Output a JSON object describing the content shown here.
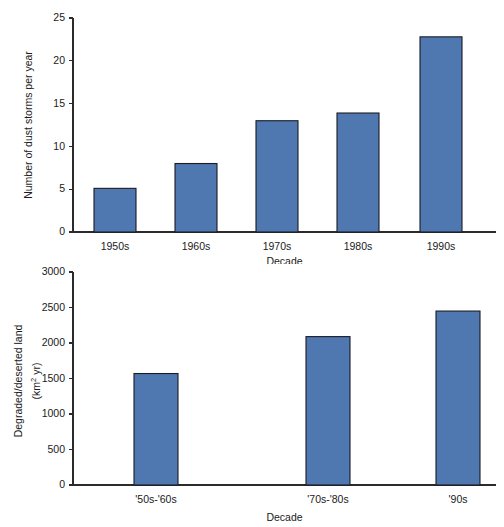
{
  "chart_data": [
    {
      "type": "bar",
      "title": "",
      "categories": [
        "1950s",
        "1960s",
        "1970s",
        "1980s",
        "1990s"
      ],
      "values": [
        5.1,
        8.0,
        13.0,
        13.9,
        22.8
      ],
      "xlabel": "Decade",
      "ylabel": "Number of dust storms per year",
      "ylim": [
        0,
        25
      ],
      "yticks": [
        0,
        5,
        10,
        15,
        20,
        25
      ],
      "ytick_labels": [
        "0",
        "5",
        "10",
        "15",
        "20",
        "25"
      ],
      "grid": false,
      "legend": "none",
      "bar_color": "#4F77B0",
      "bar_edge_color": "#1B1B24"
    },
    {
      "type": "bar",
      "title": "",
      "categories": [
        "'50s-'60s",
        "'70s-'80s",
        "'90s"
      ],
      "values": [
        1570,
        2090,
        2450
      ],
      "xlabel": "Decade",
      "ylabel": "Degraded/deserted land",
      "ylabel_units": "(km2 yr)",
      "ylabel_units_base": "(km",
      "ylabel_units_sup": "2",
      "ylabel_units_tail": " yr)",
      "ylim": [
        0,
        3000
      ],
      "yticks": [
        0,
        500,
        1000,
        1500,
        2000,
        2500,
        3000
      ],
      "ytick_labels": [
        "0",
        "500",
        "1000",
        "1500",
        "2000",
        "2500",
        "3000"
      ],
      "grid": false,
      "legend": "none",
      "bar_color": "#4F77B0",
      "bar_edge_color": "#1B1B24"
    }
  ]
}
